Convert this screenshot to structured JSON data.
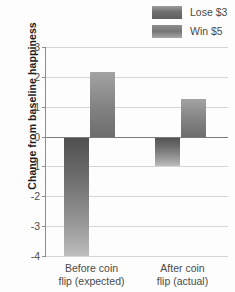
{
  "chart_data": {
    "type": "bar",
    "title": "",
    "subtitle": "",
    "xlabel": "",
    "ylabel": "Change from baseline happiness",
    "categories": [
      "Before coin flip (expected)",
      "After coin flip (actual)"
    ],
    "category_lines": [
      [
        "Before coin",
        "flip (expected)"
      ],
      [
        "After coin",
        "flip (actual)"
      ]
    ],
    "series": [
      {
        "name": "Lose $3",
        "values": [
          -4.0,
          -1.0
        ],
        "color": "#757575"
      },
      {
        "name": "Win $5",
        "values": [
          2.15,
          1.25
        ],
        "color": "#8c8c8c"
      }
    ],
    "ylim": [
      -4,
      3
    ],
    "yticks": [
      3,
      2,
      1,
      0,
      -1,
      -2,
      -3,
      -4
    ],
    "ytick_labels": [
      "3",
      "2",
      "1",
      "0",
      "-1",
      "-2",
      "-3",
      "-4"
    ],
    "grid": true,
    "grid_axis": "y",
    "zero_line": 0,
    "legend_position": "top-right",
    "legend": [
      "Lose $3",
      "Win $5"
    ]
  },
  "legend": {
    "items": [
      {
        "label": "Lose $3",
        "swatch": "lose-swatch"
      },
      {
        "label": "Win $5",
        "swatch": "win-swatch"
      }
    ]
  },
  "axes": {
    "y_title": "Change from baseline happiness",
    "y_ticks": [
      "3",
      "2",
      "1",
      "0",
      "-1",
      "-2",
      "-3",
      "-4"
    ],
    "x_categories": [
      {
        "line1": "Before coin",
        "line2": "flip (expected)"
      },
      {
        "line1": "After coin",
        "line2": "flip (actual)"
      }
    ]
  },
  "colors": {
    "grid": "#d6d6d6",
    "axis": "#8d8d8d",
    "zero_line": "#7a7a7a",
    "lose_bar": "#757575",
    "win_bar": "#8c8c8c",
    "text": "#4a4a4a",
    "title_text": "#1d1d1d",
    "background": "#fdfdfd"
  }
}
